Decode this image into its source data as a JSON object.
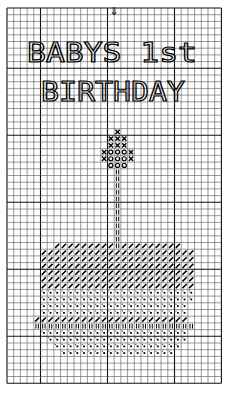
{
  "pattern": {
    "title_line1": "BABYS 1st",
    "title_line2": "BIRTHDAY",
    "center_marker": "⇓",
    "grid": {
      "origin_x": 7,
      "origin_y": 8,
      "cell": 6.7,
      "cols": 32,
      "rows": 56,
      "thick_every": 10,
      "thick_offset_col": 5,
      "thick_offset_row": 9,
      "line_color": "#555555",
      "thick_color": "#111111"
    },
    "symbols": {
      "x": "cross-stitch",
      "o": "circle-stitch",
      "/": "diagonal-stitch",
      "|": "double-bar-stitch",
      ".": "dot-stitch"
    },
    "regions": [
      {
        "symbol": "x",
        "row": 18,
        "from": 16,
        "to": 16
      },
      {
        "symbol": "x",
        "row": 19,
        "from": 15,
        "to": 17
      },
      {
        "symbol": "x",
        "row": 20,
        "from": 15,
        "to": 17
      },
      {
        "symbol": "x",
        "row": 21,
        "from": 14,
        "to": 14
      },
      {
        "symbol": "o",
        "row": 21,
        "from": 15,
        "to": 17
      },
      {
        "symbol": "x",
        "row": 21,
        "from": 18,
        "to": 18
      },
      {
        "symbol": "x",
        "row": 22,
        "from": 14,
        "to": 14
      },
      {
        "symbol": "o",
        "row": 22,
        "from": 15,
        "to": 17
      },
      {
        "symbol": "x",
        "row": 22,
        "from": 18,
        "to": 18
      },
      {
        "symbol": "o",
        "row": 23,
        "from": 15,
        "to": 17
      },
      {
        "symbol": "|",
        "row": 24,
        "from": 16,
        "to": 16
      },
      {
        "symbol": "|",
        "row": 25,
        "from": 16,
        "to": 16
      },
      {
        "symbol": "|",
        "row": 26,
        "from": 16,
        "to": 16
      },
      {
        "symbol": "|",
        "row": 27,
        "from": 16,
        "to": 16
      },
      {
        "symbol": "|",
        "row": 28,
        "from": 16,
        "to": 16
      },
      {
        "symbol": "|",
        "row": 29,
        "from": 16,
        "to": 16
      },
      {
        "symbol": "|",
        "row": 30,
        "from": 16,
        "to": 16
      },
      {
        "symbol": "|",
        "row": 31,
        "from": 16,
        "to": 16
      },
      {
        "symbol": "|",
        "row": 32,
        "from": 16,
        "to": 16
      },
      {
        "symbol": "|",
        "row": 33,
        "from": 16,
        "to": 16
      },
      {
        "symbol": "|",
        "row": 34,
        "from": 16,
        "to": 16
      },
      {
        "symbol": "/",
        "row": 35,
        "from": 7,
        "to": 15
      },
      {
        "symbol": "|",
        "row": 35,
        "from": 16,
        "to": 16
      },
      {
        "symbol": "/",
        "row": 35,
        "from": 17,
        "to": 25
      },
      {
        "symbol": "/",
        "row": 36,
        "from": 5,
        "to": 27
      },
      {
        "symbol": "/",
        "row": 37,
        "from": 5,
        "to": 27
      },
      {
        "symbol": "/",
        "row": 38,
        "from": 5,
        "to": 27
      },
      {
        "symbol": "/",
        "row": 39,
        "from": 5,
        "to": 27
      },
      {
        "symbol": "/",
        "row": 40,
        "from": 5,
        "to": 27
      },
      {
        "symbol": "/",
        "row": 41,
        "from": 5,
        "to": 27
      },
      {
        "symbol": ".",
        "row": 42,
        "from": 5,
        "to": 27
      },
      {
        "symbol": ".",
        "row": 43,
        "from": 5,
        "to": 27
      },
      {
        "symbol": ".",
        "row": 44,
        "from": 5,
        "to": 26
      },
      {
        "symbol": ".",
        "row": 45,
        "from": 5,
        "to": 26
      },
      {
        "symbol": "/",
        "row": 46,
        "from": 4,
        "to": 26
      },
      {
        "symbol": "|",
        "row": 47,
        "from": 4,
        "to": 27
      },
      {
        "symbol": ".",
        "row": 48,
        "from": 5,
        "to": 26
      },
      {
        "symbol": ".",
        "row": 49,
        "from": 6,
        "to": 26
      },
      {
        "symbol": ".",
        "row": 50,
        "from": 7,
        "to": 25
      },
      {
        "symbol": ".",
        "row": 51,
        "from": 8,
        "to": 24
      }
    ]
  }
}
